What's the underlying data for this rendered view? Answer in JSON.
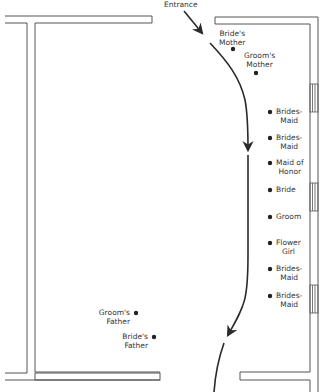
{
  "entrance_label": "Entrance",
  "guests": [
    {
      "id": "brides-mother",
      "lines": [
        "Bride's",
        "Mother"
      ],
      "dot": [
        233,
        49
      ],
      "label_pos": [
        219,
        29
      ],
      "align": "c"
    },
    {
      "id": "grooms-mother",
      "lines": [
        "Groom's",
        "Mother"
      ],
      "dot": [
        256,
        73
      ],
      "label_pos": [
        244,
        51
      ],
      "align": "c"
    }
  ],
  "party": [
    {
      "id": "bridesmaid-1",
      "lines": [
        "Brides-",
        "Maid"
      ],
      "dot": [
        270,
        112
      ]
    },
    {
      "id": "bridesmaid-2",
      "lines": [
        "Brides-",
        "Maid"
      ],
      "dot": [
        270,
        138
      ]
    },
    {
      "id": "maid-of-honor",
      "lines": [
        "Maid of",
        "Honor"
      ],
      "dot": [
        270,
        163
      ]
    },
    {
      "id": "bride",
      "lines": [
        "Bride"
      ],
      "dot": [
        270,
        190
      ]
    },
    {
      "id": "groom",
      "lines": [
        "Groom"
      ],
      "dot": [
        270,
        217
      ]
    },
    {
      "id": "flower-girl",
      "lines": [
        "Flower",
        "Girl"
      ],
      "dot": [
        270,
        243
      ]
    },
    {
      "id": "bridesmaid-3",
      "lines": [
        "Brides-",
        "Maid"
      ],
      "dot": [
        270,
        269
      ]
    },
    {
      "id": "bridesmaid-4",
      "lines": [
        "Brides-",
        "Maid"
      ],
      "dot": [
        270,
        296
      ]
    }
  ],
  "fathers": [
    {
      "id": "grooms-father",
      "lines": [
        "Groom's",
        "Father"
      ],
      "dot": [
        136,
        313
      ]
    },
    {
      "id": "brides-father",
      "lines": [
        "Bride's",
        "Father"
      ],
      "dot": [
        154,
        337
      ]
    }
  ],
  "colors": {
    "line": "#2a2a2a",
    "wall": "#555555",
    "text": "#333333"
  }
}
